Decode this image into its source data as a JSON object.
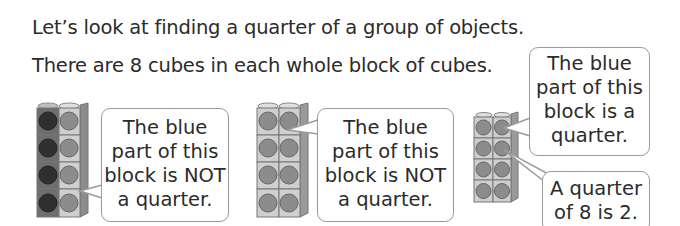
{
  "intro": {
    "line1": "Let’s look at finding a quarter of a group of objects.",
    "line2": "There are 8 cubes in each whole block of cubes."
  },
  "blocks": [
    {
      "name": "block-1",
      "cubes": 8,
      "highlighted": 4,
      "left_column_shade": "#3a3a3a",
      "right_column_shade": "#8a8a8a"
    },
    {
      "name": "block-2",
      "cubes": 8,
      "highlighted": 1,
      "shade": "#8a8a8a"
    },
    {
      "name": "block-3",
      "cubes": 8,
      "highlighted": 2,
      "shade": "#8a8a8a"
    }
  ],
  "bubbles": [
    {
      "lines": [
        "The blue",
        "part of this",
        "block is NOT",
        "a quarter."
      ]
    },
    {
      "lines": [
        "The blue",
        "part of this",
        "block is NOT",
        "a quarter."
      ]
    },
    {
      "lines": [
        "The blue",
        "part of this",
        "block is a",
        "quarter."
      ]
    },
    {
      "lines": [
        "A quarter",
        "of 8 is 2."
      ]
    }
  ],
  "colors": {
    "border": "#9a9a9a",
    "text": "#2b2b2b",
    "cube_face": "#c9c9c9",
    "dark_dot": "#3a3a3a",
    "mid_dot": "#8a8a8a"
  }
}
